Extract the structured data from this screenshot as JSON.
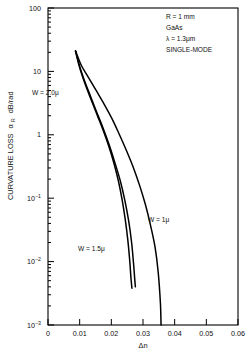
{
  "chart_data": {
    "type": "line",
    "title": "",
    "xlabel": "Δn",
    "ylabel": "CURVATURE LOSS αR dB/rad",
    "ylabel_main": "CURVATURE LOSS",
    "ylabel_symbol": "α",
    "ylabel_subscript": "R",
    "ylabel_unit": "dB/rad",
    "xlim": [
      0,
      0.06
    ],
    "ylim": [
      0.001,
      100
    ],
    "yscale": "log",
    "xscale": "linear",
    "grid": false,
    "legend": "inline-curve-labels",
    "xticks": [
      "0",
      "0.01",
      "0.02",
      "0.03",
      "0.04",
      "0.05",
      "0.06"
    ],
    "xtick_values": [
      0,
      0.01,
      0.02,
      0.03,
      0.04,
      0.05,
      0.06
    ],
    "yticks": [
      {
        "label": "100",
        "mantissa": "100",
        "exponent": "",
        "value": 100
      },
      {
        "label": "10",
        "mantissa": "10",
        "exponent": "",
        "value": 10
      },
      {
        "label": "1",
        "mantissa": "1",
        "exponent": "",
        "value": 1
      },
      {
        "label": "10-1",
        "mantissa": "10",
        "exponent": "−1",
        "value": 0.1
      },
      {
        "label": "10-2",
        "mantissa": "10",
        "exponent": "−2",
        "value": 0.01
      },
      {
        "label": "10-3",
        "mantissa": "10",
        "exponent": "−3",
        "value": 0.001
      }
    ],
    "annotations": [
      {
        "name": "radius",
        "text": "R = 1 mm"
      },
      {
        "name": "material",
        "text": "GaAs"
      },
      {
        "name": "wavelength",
        "text": "λ = 1.3μm"
      },
      {
        "name": "mode",
        "text": "SINGLE-MODE"
      }
    ],
    "series": [
      {
        "name": "W = 2.0μ",
        "label": "W = 2.0μ",
        "color": "#000000",
        "points": [
          [
            0.0087,
            21.0
          ],
          [
            0.0097,
            13.0
          ],
          [
            0.011,
            8.0
          ],
          [
            0.0125,
            5.0
          ],
          [
            0.014,
            3.2
          ],
          [
            0.0158,
            1.9
          ],
          [
            0.0175,
            1.15
          ],
          [
            0.0192,
            0.66
          ],
          [
            0.0208,
            0.36
          ],
          [
            0.0222,
            0.19
          ],
          [
            0.0234,
            0.095
          ],
          [
            0.0244,
            0.046
          ],
          [
            0.0252,
            0.022
          ],
          [
            0.0258,
            0.0105
          ],
          [
            0.0262,
            0.0055
          ],
          [
            0.0265,
            0.0038
          ]
        ]
      },
      {
        "name": "W = 1.5μ",
        "label": "W = 1.5μ",
        "color": "#000000",
        "points": [
          [
            0.0087,
            21.0
          ],
          [
            0.01,
            12.0
          ],
          [
            0.0115,
            7.2
          ],
          [
            0.0133,
            4.2
          ],
          [
            0.0152,
            2.4
          ],
          [
            0.0172,
            1.35
          ],
          [
            0.0192,
            0.72
          ],
          [
            0.021,
            0.38
          ],
          [
            0.0228,
            0.19
          ],
          [
            0.0243,
            0.091
          ],
          [
            0.0255,
            0.043
          ],
          [
            0.0264,
            0.02
          ],
          [
            0.027,
            0.0095
          ],
          [
            0.0274,
            0.0052
          ],
          [
            0.0276,
            0.004
          ]
        ]
      },
      {
        "name": "W = 1μ",
        "label": "W = 1μ",
        "color": "#000000",
        "points": [
          [
            0.0087,
            21.0
          ],
          [
            0.0105,
            12.5
          ],
          [
            0.0128,
            8.0
          ],
          [
            0.0152,
            5.0
          ],
          [
            0.0178,
            3.0
          ],
          [
            0.0202,
            1.8
          ],
          [
            0.0225,
            1.02
          ],
          [
            0.0248,
            0.56
          ],
          [
            0.027,
            0.3
          ],
          [
            0.029,
            0.155
          ],
          [
            0.0308,
            0.078
          ],
          [
            0.0324,
            0.037
          ],
          [
            0.0338,
            0.017
          ],
          [
            0.0348,
            0.0068
          ],
          [
            0.0355,
            0.0022
          ],
          [
            0.0357,
            0.001
          ]
        ]
      }
    ],
    "curve_labels": [
      {
        "name": "label-w20",
        "text": "W = 2.0μ",
        "x_px": 32,
        "y_px": 95
      },
      {
        "name": "label-w15",
        "text": "W = 1.5μ",
        "x_px": 78,
        "y_px": 251
      },
      {
        "name": "label-w1",
        "text": "W = 1μ",
        "x_px": 148,
        "y_px": 222
      }
    ]
  },
  "plot_geometry": {
    "left_px": 48,
    "right_px": 238,
    "top_px": 8,
    "bottom_px": 325
  }
}
